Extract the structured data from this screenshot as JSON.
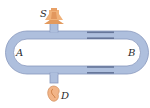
{
  "diagram": {
    "type": "acoustic interference tube",
    "labels": {
      "source": "S",
      "left_arm": "A",
      "right_arm": "B",
      "detector": "D"
    },
    "components": [
      {
        "id": "speaker",
        "label": "S",
        "description": "sound source (loudspeaker horn) at top"
      },
      {
        "id": "ear",
        "label": "D",
        "description": "detector (ear) at bottom"
      },
      {
        "id": "left-path",
        "label": "A",
        "description": "fixed left tube path"
      },
      {
        "id": "right-path",
        "label": "B",
        "description": "sliding right tube path (adjustable length)"
      }
    ],
    "colors": {
      "tube_fill": "#aebfdd",
      "tube_outline": "#7d90b8",
      "slide_stripe": "#5a6a8e",
      "speaker": "#e8a066",
      "speaker_dark": "#c8763a",
      "ear": "#f0b080",
      "ear_dark": "#c87a4a"
    }
  }
}
